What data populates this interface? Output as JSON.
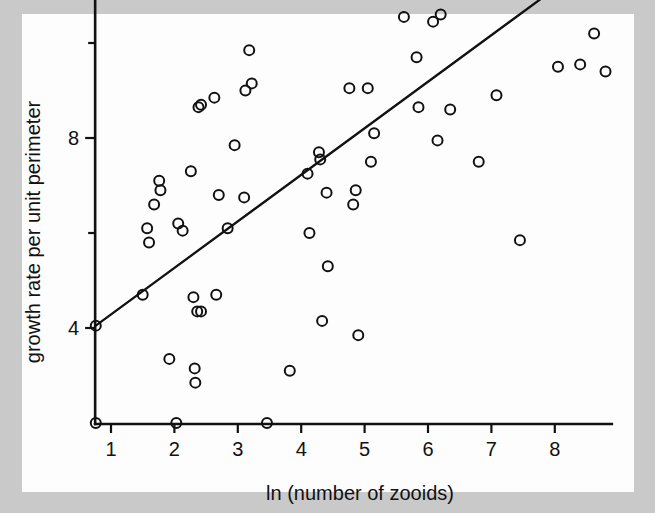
{
  "figure": {
    "background_color": "#c9c9c9",
    "plate_color": "#fdfdfd",
    "ink_color": "#111111"
  },
  "chart_data": {
    "type": "scatter",
    "title": "",
    "xlabel": "ln (number of zooids)",
    "ylabel": "growth rate per unit perimeter",
    "xlim": [
      0.75,
      8.9
    ],
    "ylim": [
      1.0,
      17.0
    ],
    "grid": false,
    "legend": null,
    "x_ticks": [
      1,
      2,
      3,
      4,
      5,
      6,
      7,
      8
    ],
    "x_tick_labels": [
      "1",
      "2",
      "3",
      "4",
      "5",
      "6",
      "7",
      "8"
    ],
    "y_ticks": [
      4,
      8,
      12,
      16
    ],
    "y_tick_labels": [
      "4",
      "8",
      "12",
      "16"
    ],
    "y_minor_ticks": [
      6,
      10,
      14
    ],
    "marker": "open-circle",
    "points": [
      [
        0.76,
        2.0
      ],
      [
        0.76,
        4.05
      ],
      [
        1.5,
        4.7
      ],
      [
        1.57,
        6.1
      ],
      [
        1.6,
        5.8
      ],
      [
        1.68,
        6.6
      ],
      [
        1.76,
        7.1
      ],
      [
        1.78,
        6.9
      ],
      [
        1.92,
        3.35
      ],
      [
        2.03,
        2.0
      ],
      [
        2.06,
        6.2
      ],
      [
        2.13,
        6.05
      ],
      [
        2.26,
        7.3
      ],
      [
        2.3,
        4.65
      ],
      [
        2.32,
        3.15
      ],
      [
        2.33,
        2.85
      ],
      [
        2.36,
        4.35
      ],
      [
        2.42,
        4.35
      ],
      [
        2.38,
        8.65
      ],
      [
        2.42,
        8.7
      ],
      [
        2.63,
        8.85
      ],
      [
        2.66,
        4.7
      ],
      [
        2.7,
        6.8
      ],
      [
        2.84,
        6.1
      ],
      [
        2.95,
        7.85
      ],
      [
        3.12,
        9.0
      ],
      [
        3.18,
        9.85
      ],
      [
        3.22,
        9.15
      ],
      [
        3.1,
        6.75
      ],
      [
        3.46,
        2.0
      ],
      [
        3.82,
        3.1
      ],
      [
        4.1,
        7.25
      ],
      [
        4.13,
        6.0
      ],
      [
        4.28,
        7.7
      ],
      [
        4.3,
        7.55
      ],
      [
        4.33,
        4.15
      ],
      [
        4.4,
        6.85
      ],
      [
        4.42,
        5.3
      ],
      [
        4.76,
        9.05
      ],
      [
        4.82,
        6.6
      ],
      [
        4.86,
        6.9
      ],
      [
        4.9,
        3.85
      ],
      [
        5.05,
        9.05
      ],
      [
        5.1,
        7.5
      ],
      [
        5.15,
        8.1
      ],
      [
        5.18,
        12.1
      ],
      [
        5.55,
        11.55
      ],
      [
        5.58,
        11.35
      ],
      [
        5.62,
        10.55
      ],
      [
        5.8,
        11.1
      ],
      [
        5.82,
        9.7
      ],
      [
        5.85,
        8.65
      ],
      [
        6.05,
        11.85
      ],
      [
        6.08,
        10.45
      ],
      [
        6.2,
        10.6
      ],
      [
        6.15,
        7.95
      ],
      [
        6.35,
        11.6
      ],
      [
        6.35,
        8.6
      ],
      [
        6.75,
        13.8
      ],
      [
        6.8,
        7.5
      ],
      [
        7.08,
        8.9
      ],
      [
        7.45,
        5.85
      ],
      [
        7.8,
        14.1
      ],
      [
        8.05,
        15.05
      ],
      [
        8.05,
        9.5
      ],
      [
        8.3,
        16.5
      ],
      [
        8.35,
        11.2
      ],
      [
        8.4,
        9.55
      ],
      [
        8.62,
        10.2
      ],
      [
        8.65,
        11.85
      ],
      [
        8.68,
        12.3
      ],
      [
        8.78,
        11.15
      ],
      [
        8.8,
        9.4
      ]
    ],
    "fit_line": {
      "x_start": 0.76,
      "y_start": 4.05,
      "x_end": 8.72,
      "y_end": 11.85
    }
  }
}
